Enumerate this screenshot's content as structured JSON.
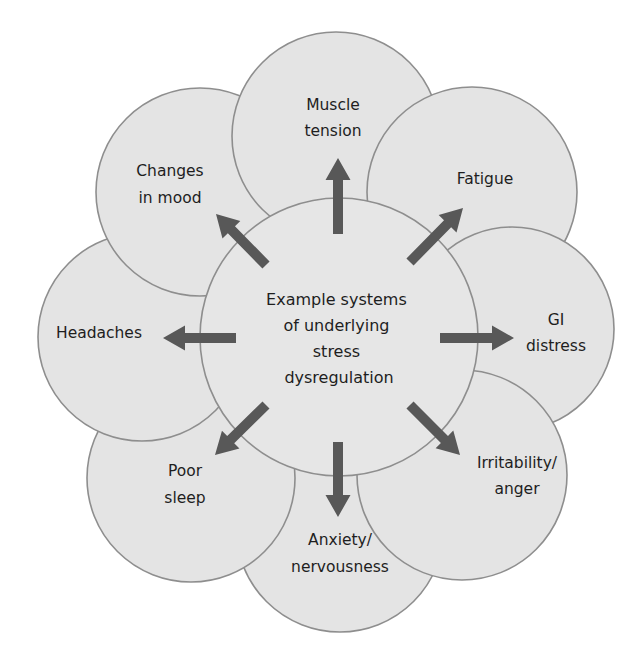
{
  "diagram": {
    "title": "Example systems of underlying stress dysregulation",
    "colors": {
      "circle_fill": "#e4e4e4",
      "circle_stroke": "#8e8e8e",
      "arrow": "#585858",
      "text": "#1e1e1e",
      "background": "#ffffff"
    },
    "center": {
      "lines": [
        "Example systems",
        "of underlying",
        "stress",
        "dysregulation"
      ],
      "cx": 339,
      "cy": 337,
      "r": 139
    },
    "petals": [
      {
        "id": "muscle-tension",
        "lines": [
          "Muscle",
          "tension"
        ],
        "cx": 336,
        "cy": 136,
        "r": 104,
        "direction": "up"
      },
      {
        "id": "fatigue",
        "lines": [
          "Fatigue"
        ],
        "cx": 472,
        "cy": 192,
        "r": 105,
        "direction": "up-right"
      },
      {
        "id": "gi-distress",
        "lines": [
          "GI",
          "distress"
        ],
        "cx": 512,
        "cy": 329,
        "r": 102,
        "direction": "right"
      },
      {
        "id": "irritability-anger",
        "lines": [
          "Irritability/",
          "anger"
        ],
        "cx": 462,
        "cy": 475,
        "r": 105,
        "direction": "down-right"
      },
      {
        "id": "anxiety-nervousness",
        "lines": [
          "Anxiety/",
          "nervousness"
        ],
        "cx": 340,
        "cy": 528,
        "r": 104,
        "direction": "down"
      },
      {
        "id": "poor-sleep",
        "lines": [
          "Poor",
          "sleep"
        ],
        "cx": 191,
        "cy": 478,
        "r": 104,
        "direction": "down-left"
      },
      {
        "id": "headaches",
        "lines": [
          "Headaches"
        ],
        "cx": 142,
        "cy": 337,
        "r": 104,
        "direction": "left"
      },
      {
        "id": "changes-in-mood",
        "lines": [
          "Changes",
          "in mood"
        ],
        "cx": 200,
        "cy": 192,
        "r": 104,
        "direction": "up-left"
      }
    ]
  }
}
